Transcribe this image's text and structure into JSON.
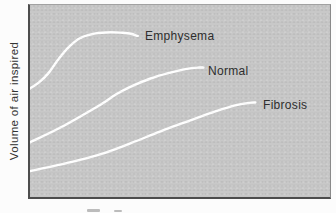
{
  "colors": {
    "canvas_white": "#fcfcfc",
    "panel_gray": "#c8c8c8",
    "panel_border_dark": "#4d4d4d",
    "panel_border_light": "#a2a2a2",
    "curve_white": "#ffffff",
    "text": "#2d2d2d"
  },
  "chart_data": {
    "type": "line",
    "title": "",
    "xlabel": "",
    "ylabel": "Volume of air inspired",
    "grid": false,
    "axes_ticks": {
      "x": [],
      "y": []
    },
    "x_range": [
      0,
      1
    ],
    "y_range": [
      0,
      1
    ],
    "units_note": "qualitative axes; point values normalized to plot area (x = fraction of width, y = fraction of height from bottom)",
    "legend_position": "inline-labels",
    "series": [
      {
        "name": "Emphysema",
        "color": "#ffffff",
        "label_px": {
          "x": 115,
          "y": 24
        },
        "points": [
          [
            0.0,
            0.565
          ],
          [
            0.03,
            0.597
          ],
          [
            0.063,
            0.648
          ],
          [
            0.096,
            0.72
          ],
          [
            0.13,
            0.782
          ],
          [
            0.169,
            0.829
          ],
          [
            0.219,
            0.852
          ],
          [
            0.269,
            0.858
          ],
          [
            0.309,
            0.855
          ],
          [
            0.336,
            0.85
          ],
          [
            0.359,
            0.839
          ]
        ]
      },
      {
        "name": "Normal",
        "color": "#ffffff",
        "label_px": {
          "x": 178,
          "y": 59
        },
        "points": [
          [
            0.0,
            0.285
          ],
          [
            0.103,
            0.363
          ],
          [
            0.236,
            0.482
          ],
          [
            0.286,
            0.534
          ],
          [
            0.336,
            0.575
          ],
          [
            0.402,
            0.617
          ],
          [
            0.468,
            0.648
          ],
          [
            0.518,
            0.666
          ],
          [
            0.558,
            0.674
          ],
          [
            0.578,
            0.674
          ]
        ]
      },
      {
        "name": "Fibrosis",
        "color": "#ffffff",
        "label_px": {
          "x": 233,
          "y": 93
        },
        "points": [
          [
            0.0,
            0.135
          ],
          [
            0.136,
            0.181
          ],
          [
            0.236,
            0.223
          ],
          [
            0.336,
            0.28
          ],
          [
            0.435,
            0.342
          ],
          [
            0.535,
            0.399
          ],
          [
            0.618,
            0.446
          ],
          [
            0.684,
            0.477
          ],
          [
            0.731,
            0.49
          ],
          [
            0.751,
            0.492
          ]
        ]
      }
    ]
  }
}
